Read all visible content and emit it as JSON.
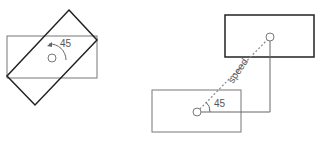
{
  "diagram": {
    "left_figure": {
      "rotation_label": "45",
      "axis_rect": {
        "x": 7,
        "y": 36,
        "w": 90,
        "h": 42,
        "color": "#777777"
      },
      "rotated_rect": {
        "points": "69,10 97,40 35,105 7,76",
        "color": "#222222"
      },
      "pivot": {
        "cx": 52,
        "cy": 58,
        "r": 4
      }
    },
    "right_figure": {
      "target_rect": {
        "x": 225,
        "y": 15,
        "w": 89,
        "h": 42,
        "color": "#222222"
      },
      "source_rect": {
        "x": 152,
        "y": 90,
        "w": 89,
        "h": 42,
        "color": "#777777"
      },
      "source_point": {
        "cx": 197,
        "cy": 112,
        "r": 4
      },
      "target_point": {
        "cx": 270,
        "cy": 37,
        "r": 4
      },
      "speed_label": "speed",
      "angle_label": "45"
    },
    "colors": {
      "dark_stroke": "#222222",
      "light_stroke": "#777777",
      "dashed": "#888888",
      "text": "#555555"
    }
  }
}
